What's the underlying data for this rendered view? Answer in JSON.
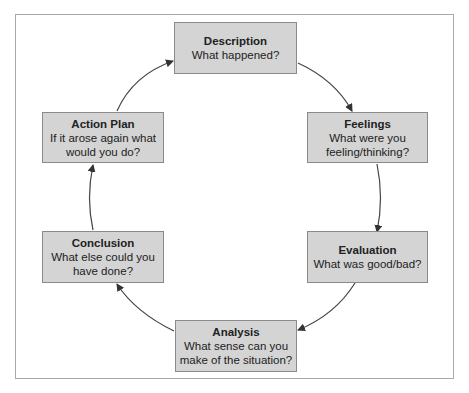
{
  "diagram": {
    "type": "cycle",
    "nodes": [
      {
        "id": "description",
        "title": "Description",
        "question": "What happened?"
      },
      {
        "id": "feelings",
        "title": "Feelings",
        "question_line1": "What were you",
        "question_line2": "feeling/thinking?"
      },
      {
        "id": "evaluation",
        "title": "Evaluation",
        "question": "What was good/bad?"
      },
      {
        "id": "analysis",
        "title": "Analysis",
        "question_line1": "What sense can you",
        "question_line2": "make of the situation?"
      },
      {
        "id": "conclusion",
        "title": "Conclusion",
        "question_line1": "What else could you",
        "question_line2": "have done?"
      },
      {
        "id": "action_plan",
        "title": "Action Plan",
        "question_line1": "If it arose again what",
        "question_line2": "would you do?"
      }
    ],
    "edges": [
      [
        "description",
        "feelings"
      ],
      [
        "feelings",
        "evaluation"
      ],
      [
        "evaluation",
        "analysis"
      ],
      [
        "analysis",
        "conclusion"
      ],
      [
        "conclusion",
        "action_plan"
      ],
      [
        "action_plan",
        "description"
      ]
    ],
    "colors": {
      "box_fill": "#d4d4d4",
      "box_border": "#8a8a8a",
      "arrow": "#333333",
      "frame": "#a9a9a9"
    }
  }
}
